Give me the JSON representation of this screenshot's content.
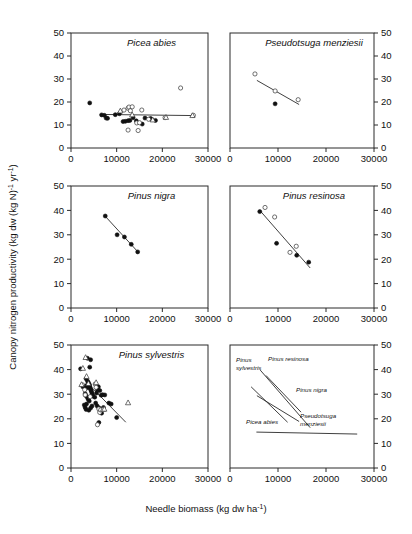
{
  "figure": {
    "xlabel": "Needle biomass (kg dw ha",
    "xlabel_sup": "-1",
    "xlabel_tail": ")",
    "ylabel_a": "Canopy nitrogen productivity (kg dw (kg N)",
    "ylabel_sup1": "-1",
    "ylabel_mid": " yr",
    "ylabel_sup2": "-1",
    "ylabel_tail": ")",
    "xticks": [
      "0",
      "10000",
      "20000",
      "30000"
    ],
    "yticks": [
      "0",
      "10",
      "20",
      "30",
      "40",
      "50"
    ],
    "xlim": [
      0,
      30000
    ],
    "ylim": [
      0,
      50
    ]
  },
  "chart_data": {
    "type": "scatter",
    "xlabel": "Needle biomass (kg dw ha-1)",
    "ylabel": "Canopy nitrogen productivity (kg dw (kg N)-1 yr-1)",
    "xlim": [
      0,
      30000
    ],
    "ylim": [
      0,
      50
    ],
    "xticks": [
      0,
      10000,
      20000,
      30000
    ],
    "yticks": [
      0,
      10,
      20,
      30,
      40,
      50
    ],
    "grid": false,
    "legend": "none",
    "panels": [
      {
        "id": "picea-abies",
        "title": "Picea abies",
        "row": 1,
        "col": 1,
        "yaxis_side": "left",
        "series": [
          {
            "name": "filled-circle",
            "marker": "filled circle",
            "points": [
              [
                4100,
                19.6
              ],
              [
                6700,
                14.4
              ],
              [
                7300,
                14.2
              ],
              [
                7700,
                13.0
              ],
              [
                8000,
                12.9
              ],
              [
                9700,
                14.5
              ],
              [
                10600,
                14.9
              ],
              [
                11400,
                11.5
              ],
              [
                11900,
                11.6
              ],
              [
                12500,
                11.9
              ],
              [
                12900,
                12.0
              ],
              [
                13600,
                13.2
              ],
              [
                14300,
                11.8
              ],
              [
                15600,
                10.4
              ],
              [
                16200,
                13.0
              ],
              [
                17400,
                12.8
              ],
              [
                17600,
                12.6
              ],
              [
                18500,
                12.0
              ]
            ]
          },
          {
            "name": "open-circle",
            "marker": "open circle",
            "points": [
              [
                11600,
                16.5
              ],
              [
                12500,
                17.3
              ],
              [
                12700,
                17.8
              ],
              [
                12500,
                7.8
              ],
              [
                13000,
                16.2
              ],
              [
                13400,
                17.9
              ],
              [
                14400,
                10.9
              ],
              [
                14700,
                7.6
              ],
              [
                15000,
                11.0
              ],
              [
                15500,
                16.5
              ],
              [
                17000,
                12.5
              ],
              [
                20600,
                13.2
              ],
              [
                24000,
                26.1
              ],
              [
                26800,
                14.2
              ]
            ]
          },
          {
            "name": "open-triangle",
            "marker": "open triangle",
            "points": [
              [
                10800,
                16.2
              ],
              [
                13400,
                14.5
              ],
              [
                17900,
                12.3
              ],
              [
                20800,
                13.4
              ],
              [
                26600,
                14.2
              ]
            ]
          }
        ],
        "fit_line": [
          [
            6300,
            14.6
          ],
          [
            26800,
            14.1
          ]
        ]
      },
      {
        "id": "pseudotsuga-menziesii",
        "title": "Pseudotsuga menziesii",
        "row": 1,
        "col": 2,
        "yaxis_side": "right",
        "series": [
          {
            "name": "open-circle",
            "marker": "open circle",
            "points": [
              [
                5200,
                32.2
              ],
              [
                9400,
                24.8
              ],
              [
                14200,
                21.0
              ]
            ]
          },
          {
            "name": "filled-circle",
            "marker": "filled circle",
            "points": [
              [
                9400,
                19.2
              ]
            ]
          }
        ],
        "fit_line": [
          [
            5600,
            29.4
          ],
          [
            14400,
            18.9
          ]
        ]
      },
      {
        "id": "pinus-nigra",
        "title": "Pinus nigra",
        "row": 2,
        "col": 1,
        "yaxis_side": "left",
        "series": [
          {
            "name": "filled-circle",
            "marker": "filled circle",
            "points": [
              [
                7500,
                37.7
              ],
              [
                10100,
                30.0
              ],
              [
                11700,
                29.1
              ],
              [
                13200,
                26.1
              ],
              [
                14600,
                23.0
              ]
            ]
          }
        ],
        "fit_line": [
          [
            7500,
            37.6
          ],
          [
            14800,
            22.7
          ]
        ]
      },
      {
        "id": "pinus-resinosa",
        "title": "Pinus resinosa",
        "row": 2,
        "col": 2,
        "yaxis_side": "right",
        "series": [
          {
            "name": "filled-circle",
            "marker": "filled circle",
            "points": [
              [
                6200,
                39.5
              ],
              [
                9700,
                26.5
              ],
              [
                13900,
                21.6
              ],
              [
                16400,
                18.8
              ]
            ]
          },
          {
            "name": "open-circle",
            "marker": "open circle",
            "points": [
              [
                7300,
                41.2
              ],
              [
                9300,
                37.3
              ],
              [
                12500,
                22.8
              ],
              [
                13800,
                25.3
              ]
            ]
          }
        ],
        "fit_line": [
          [
            6300,
            39.8
          ],
          [
            16700,
            16.4
          ]
        ]
      },
      {
        "id": "pinus-sylvestris",
        "title": "Pinus sylvestris",
        "row": 3,
        "col": 1,
        "yaxis_side": "left",
        "series": [
          {
            "name": "filled-circle",
            "marker": "filled circle",
            "points": [
              [
                2100,
                40.3
              ],
              [
                3600,
                44.6
              ],
              [
                4300,
                44.0
              ],
              [
                4100,
                41.0
              ],
              [
                3300,
                36.3
              ],
              [
                3600,
                35.4
              ],
              [
                3800,
                34.8
              ],
              [
                4000,
                34.0
              ],
              [
                4100,
                33.3
              ],
              [
                4200,
                32.6
              ],
              [
                4300,
                32.0
              ],
              [
                4400,
                31.5
              ],
              [
                4500,
                31.0
              ],
              [
                4600,
                30.3
              ],
              [
                4700,
                29.8
              ],
              [
                4800,
                29.2
              ],
              [
                3400,
                33.5
              ],
              [
                3500,
                32.6
              ],
              [
                3000,
                33.2
              ],
              [
                2600,
                33.0
              ],
              [
                3100,
                30.2
              ],
              [
                3300,
                29.4
              ],
              [
                3600,
                28.6
              ],
              [
                3800,
                27.8
              ],
              [
                4000,
                27.2
              ],
              [
                3400,
                26.0
              ],
              [
                2900,
                25.6
              ],
              [
                3100,
                24.6
              ],
              [
                3300,
                23.8
              ],
              [
                3900,
                23.5
              ],
              [
                4300,
                24.4
              ],
              [
                4600,
                25.2
              ],
              [
                5200,
                28.8
              ],
              [
                5600,
                30.5
              ],
              [
                5800,
                31.8
              ],
              [
                6000,
                33.0
              ],
              [
                6300,
                31.5
              ],
              [
                6600,
                29.6
              ],
              [
                6900,
                29.8
              ],
              [
                7400,
                29.7
              ],
              [
                5400,
                26.4
              ],
              [
                5700,
                25.3
              ],
              [
                6100,
                24.5
              ],
              [
                6400,
                23.0
              ],
              [
                6700,
                22.3
              ],
              [
                7100,
                24.6
              ],
              [
                8300,
                26.4
              ],
              [
                8800,
                26.0
              ],
              [
                10000,
                20.5
              ],
              [
                6100,
                18.5
              ]
            ]
          },
          {
            "name": "open-circle",
            "marker": "open circle",
            "points": [
              [
                2500,
                33.8
              ],
              [
                3000,
                31.8
              ],
              [
                3100,
                29.7
              ],
              [
                5300,
                34.1
              ],
              [
                5500,
                32.8
              ],
              [
                6100,
                24.0
              ],
              [
                6300,
                22.6
              ],
              [
                6500,
                23.6
              ],
              [
                5800,
                17.6
              ],
              [
                4200,
                29.0
              ]
            ]
          },
          {
            "name": "open-triangle",
            "marker": "open triangle",
            "points": [
              [
                3200,
                45.0
              ],
              [
                2600,
                40.6
              ],
              [
                3400,
                37.3
              ],
              [
                3800,
                34.4
              ],
              [
                5500,
                34.8
              ],
              [
                7000,
                23.9
              ],
              [
                7300,
                24.0
              ],
              [
                12500,
                26.6
              ],
              [
                2300,
                34.0
              ]
            ]
          }
        ],
        "fit_line": [
          [
            4400,
            33.0
          ],
          [
            12000,
            18.6
          ]
        ]
      },
      {
        "id": "summary-lines",
        "title": "",
        "row": 3,
        "col": 2,
        "yaxis_side": "right",
        "summary": true,
        "lines": [
          {
            "label": "Picea abies",
            "from": [
              5500,
              14.6
            ],
            "to": [
              26500,
              13.8
            ]
          },
          {
            "label": "Pseudotsuga menziesii",
            "from": [
              5600,
              29.4
            ],
            "to": [
              14400,
              18.9
            ]
          },
          {
            "label": "Pinus nigra",
            "from": [
              7500,
              37.6
            ],
            "to": [
              14800,
              22.7
            ]
          },
          {
            "label": "Pinus resinosa",
            "from": [
              6300,
              39.8
            ],
            "to": [
              16700,
              16.4
            ]
          },
          {
            "label": "Pinus sylvestris",
            "from": [
              4400,
              33.0
            ],
            "to": [
              12000,
              18.6
            ]
          }
        ],
        "annotations": [
          {
            "id": "ann-pinus-sylvestris",
            "text_line1": "Pinus",
            "text_line2": "sylvestris"
          },
          {
            "id": "ann-pinus-resinosa",
            "text_line1": "Pinus resinosa",
            "text_line2": ""
          },
          {
            "id": "ann-pinus-nigra",
            "text_line1": "Pinus nigra",
            "text_line2": ""
          },
          {
            "id": "ann-pseudotsuga-menziesii",
            "text_line1": "Pseudotsuga",
            "text_line2": "menziesii"
          },
          {
            "id": "ann-picea-abies",
            "text_line1": "Picea abies",
            "text_line2": ""
          }
        ]
      }
    ]
  }
}
